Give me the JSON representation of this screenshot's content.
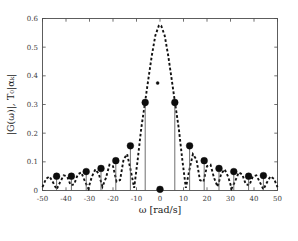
{
  "figure": {
    "background": "#ffffff",
    "axes_color": "#4d4d4d",
    "marker_color": "#0d0d0d",
    "envelope_color": "#111111"
  },
  "chart_data": {
    "type": "line",
    "title": "",
    "subtitle": "",
    "xlabel": "ω [rad/s]",
    "ylabel": "|G(ω)|, T₀|αₖ|",
    "xlim": [
      -50,
      50
    ],
    "ylim": [
      0,
      0.6
    ],
    "xticks": [
      -50,
      -40,
      -30,
      -20,
      -10,
      0,
      10,
      20,
      30,
      40,
      50
    ],
    "xticklabels": [
      "-50",
      "-40",
      "-30",
      "-20",
      "-10",
      "0",
      "10",
      "20",
      "30",
      "40",
      "50"
    ],
    "yticks": [
      0,
      0.1,
      0.2,
      0.3,
      0.4,
      0.5,
      0.6
    ],
    "yticklabels": [
      "0",
      "0.1",
      "0.2",
      "0.3",
      "0.4",
      "0.5",
      "0.6"
    ],
    "grid": false,
    "legend": null,
    "series": [
      {
        "name": "|G(ω)| envelope",
        "style": "dashed",
        "color": "#111111",
        "linewidth": 1.9,
        "peak_value": 0.578,
        "peak_x": 0,
        "description": "dashed sinc-like magnitude envelope of the pulse spectrum",
        "x": [
          -50,
          -48.5,
          -47,
          -45.5,
          -44,
          -42.5,
          -41,
          -39.5,
          -38,
          -36.5,
          -35,
          -33.5,
          -32,
          -30.5,
          -29,
          -27.5,
          -26,
          -24.5,
          -23,
          -21.5,
          -20,
          -18.5,
          -17,
          -15.5,
          -14,
          -12.5,
          -11,
          -9.5,
          -8,
          -6.5,
          -5,
          -3.5,
          -2,
          -0.5,
          0,
          0.5,
          2,
          3.5,
          5,
          6.5,
          8,
          9.5,
          11,
          12.5,
          14,
          15.5,
          17,
          18.5,
          20,
          21.5,
          23,
          24.5,
          26,
          27.5,
          29,
          30.5,
          32,
          33.5,
          35,
          36.5,
          38,
          39.5,
          41,
          42.5,
          44,
          45.5,
          47,
          48.5,
          50
        ],
        "y": [
          0.012,
          0.041,
          0.049,
          0.028,
          0.004,
          0.029,
          0.053,
          0.049,
          0.018,
          0.022,
          0.056,
          0.063,
          0.033,
          0.007,
          0.048,
          0.074,
          0.057,
          0.013,
          0.044,
          0.09,
          0.085,
          0.031,
          0.036,
          0.108,
          0.127,
          0.072,
          0.009,
          0.107,
          0.216,
          0.3,
          0.386,
          0.47,
          0.54,
          0.575,
          0.578,
          0.575,
          0.54,
          0.47,
          0.386,
          0.3,
          0.216,
          0.107,
          0.009,
          0.072,
          0.127,
          0.108,
          0.036,
          0.031,
          0.085,
          0.09,
          0.044,
          0.013,
          0.057,
          0.074,
          0.048,
          0.007,
          0.033,
          0.063,
          0.056,
          0.022,
          0.018,
          0.049,
          0.053,
          0.029,
          0.004,
          0.028,
          0.049,
          0.041,
          0.012
        ]
      },
      {
        "name": "T₀|αₖ| stem samples",
        "style": "stem",
        "color": "#0d0d0d",
        "description": "discrete Fourier series coefficients sampled at multiples of ω₀ ≈ 6.28 rad/s",
        "x": [
          -44.0,
          -37.7,
          -31.4,
          -25.1,
          -18.8,
          -12.6,
          -6.3,
          0.0,
          6.3,
          12.6,
          18.8,
          25.1,
          31.4,
          37.7,
          44.0
        ],
        "y": [
          0.05,
          0.05,
          0.066,
          0.077,
          0.104,
          0.156,
          0.307,
          0.004,
          0.307,
          0.156,
          0.104,
          0.077,
          0.066,
          0.05,
          0.052
        ]
      }
    ],
    "annotations": [
      {
        "x": -1.0,
        "y": 0.375,
        "marker": "small-dot",
        "label": ""
      }
    ]
  }
}
